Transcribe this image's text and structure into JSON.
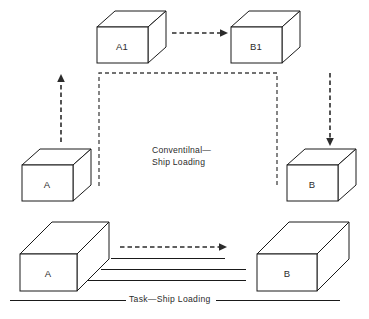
{
  "figure": {
    "type": "block-diagram",
    "background_color": "#ffffff",
    "line_color": "#1a1a1a",
    "dash_color": "#444444",
    "text_color": "#2b2b2b"
  },
  "boxes": [
    {
      "id": "a1",
      "label": "A1",
      "role": "upper-origin-unit-load"
    },
    {
      "id": "b1",
      "label": "B1",
      "role": "upper-destination-unit-load"
    },
    {
      "id": "a-left",
      "label": "A",
      "role": "conventional-origin-stack"
    },
    {
      "id": "b-right",
      "label": "B",
      "role": "conventional-destination-stack"
    },
    {
      "id": "a-bottom",
      "label": "A",
      "role": "task-origin-stack"
    },
    {
      "id": "b-bottom",
      "label": "B",
      "role": "task-destination-stack"
    }
  ],
  "captions": {
    "conventional_line1": "Conventilnal—",
    "conventional_line2": "Ship Loading",
    "task_loading": "Task—Ship  Loading"
  },
  "flows": [
    {
      "id": "a-to-a1",
      "direction": "up",
      "style": "dashed-arrow",
      "from": "A",
      "to": "A1"
    },
    {
      "id": "a1-to-b1",
      "direction": "right",
      "style": "dashed-arrow",
      "from": "A1",
      "to": "B1"
    },
    {
      "id": "b1-to-b",
      "direction": "down",
      "style": "dashed-arrow",
      "from": "B1",
      "to": "B"
    },
    {
      "id": "a-to-b-task",
      "direction": "right",
      "style": "dashed-arrow",
      "from": "A",
      "to": "B"
    },
    {
      "id": "task-rail-1",
      "direction": "right",
      "style": "solid-line"
    },
    {
      "id": "task-rail-2",
      "direction": "right",
      "style": "solid-line"
    },
    {
      "id": "task-rail-3",
      "direction": "right",
      "style": "solid-line"
    },
    {
      "id": "conventional-boundary",
      "style": "dashed-bracket"
    },
    {
      "id": "ground-baseline",
      "style": "solid-line"
    }
  ]
}
